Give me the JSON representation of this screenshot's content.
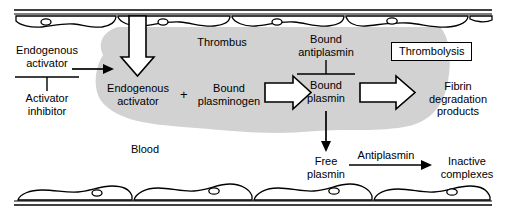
{
  "diagram": {
    "title_internal": "Fibrinolysis and thrombolysis within a blood vessel",
    "colors": {
      "thrombus_fill": "#d0d0d0",
      "stroke": "#000000",
      "background": "#ffffff",
      "arrow_fill": "#ffffff"
    },
    "labels": {
      "thrombus": "Thrombus",
      "blood": "Blood",
      "endogenous_activator_outside_l1": "Endogenous",
      "endogenous_activator_outside_l2": "activator",
      "activator_inhibitor_l1": "Activator",
      "activator_inhibitor_l2": "inhibitor",
      "endogenous_activator_inside_l1": "Endogenous",
      "endogenous_activator_inside_l2": "activator",
      "plus_sign": "+",
      "bound_plasminogen_l1": "Bound",
      "bound_plasminogen_l2": "plasminogen",
      "bound_antiplasmin_l1": "Bound",
      "bound_antiplasmin_l2": "antiplasmin",
      "bound_plasmin_l1": "Bound",
      "bound_plasmin_l2": "plasmin",
      "thrombolysis": "Thrombolysis",
      "fibrin_degradation_l1": "Fibrin",
      "fibrin_degradation_l2": "degradation",
      "fibrin_degradation_l3": "products",
      "free_plasmin_l1": "Free",
      "free_plasmin_l2": "plasmin",
      "antiplasmin": "Antiplasmin",
      "inactive_complexes_l1": "Inactive",
      "inactive_complexes_l2": "complexes"
    },
    "icon_names": {
      "vessel_wall_top": "vessel-wall-top",
      "vessel_wall_bottom": "vessel-wall-bottom",
      "endothelium_top": "endothelial-cell-layer-top",
      "endothelium_bottom": "endothelial-cell-layer-bottom",
      "thrombus_mass": "thrombus-mass",
      "big_down_arrow": "hollow-down-arrow",
      "block_arrow_1": "hollow-right-arrow-plasminogen-to-plasmin",
      "block_arrow_2": "hollow-right-arrow-plasmin-to-fdp",
      "thin_arrow_activator": "thin-right-arrow-activator-entry",
      "thin_arrow_free_plasmin": "thin-down-arrow-free-plasmin",
      "thin_arrow_antiplasmin": "thin-right-arrow-antiplasmin",
      "inhibition_bar_activator": "inhibition-t-bar-activator-inhibitor",
      "inhibition_bar_antiplasmin": "inhibition-t-bar-bound-antiplasmin"
    }
  }
}
